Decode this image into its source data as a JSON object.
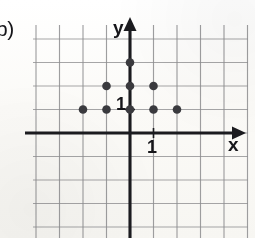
{
  "exercise": {
    "part_label": "b)"
  },
  "axes": {
    "x_label": "x",
    "y_label": "y",
    "x_tick_label": "1",
    "y_tick_label": "1",
    "axis_color": "#1b1b1f",
    "grid_color": "#8e8e90"
  },
  "chart_data": {
    "type": "scatter",
    "title": "",
    "xlabel": "x",
    "ylabel": "y",
    "xlim": [
      -5,
      5
    ],
    "ylim": [
      -4,
      4
    ],
    "grid": true,
    "legend": false,
    "x": [
      -2,
      -1,
      0,
      1,
      2,
      -1,
      0,
      1,
      0
    ],
    "y": [
      1,
      1,
      1,
      1,
      1,
      2,
      2,
      2,
      3
    ],
    "points": [
      {
        "x": -2,
        "y": 1
      },
      {
        "x": -1,
        "y": 1
      },
      {
        "x": 0,
        "y": 1
      },
      {
        "x": 1,
        "y": 1
      },
      {
        "x": 2,
        "y": 1
      },
      {
        "x": -1,
        "y": 2
      },
      {
        "x": 0,
        "y": 2
      },
      {
        "x": 1,
        "y": 2
      },
      {
        "x": 0,
        "y": 3
      }
    ],
    "marker_color": "#3a3a3e",
    "marker_size": 7,
    "xticks": [
      1
    ],
    "yticks": [
      1
    ],
    "annotations": [
      "b)"
    ]
  },
  "geometry": {
    "origin_x": 130,
    "origin_y": 133,
    "cell": 23.5,
    "grid_left": 33,
    "grid_right": 248,
    "grid_top": 25,
    "grid_bottom": 238
  }
}
